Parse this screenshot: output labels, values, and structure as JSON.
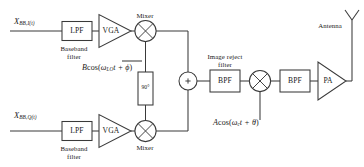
{
  "diagram": {
    "line_color": "#3a3a3a",
    "text_color": "#1a1a1a",
    "background": "#ffffff"
  },
  "inputs": {
    "i_signal": {
      "base": "X",
      "sub": "BB,I(t)",
      "tail": "(t)",
      "full": "X_BB,I(t)"
    },
    "q_signal": {
      "base": "X",
      "sub": "BB,Q(t)",
      "tail": "(t)",
      "full": "X_BB,Q(t)"
    }
  },
  "blocks": {
    "lpf_i": "LPF",
    "lpf_q": "LPF",
    "vga_i": "VGA",
    "vga_q": "VGA",
    "phase_shifter": "90°",
    "bpf_image_reject": "BPF",
    "bpf_output": "BPF",
    "pa": "PA",
    "summer": "+"
  },
  "captions": {
    "baseband_filter_i_line1": "Baseband",
    "baseband_filter_i_line2": "filter",
    "baseband_filter_q_line1": "Baseband",
    "baseband_filter_q_line2": "filter",
    "mixer_i": "Mixer",
    "mixer_q": "Mixer",
    "image_reject_line1": "Image reject",
    "image_reject_line2": "filter",
    "antenna": "Antenna"
  },
  "equations": {
    "lo_baseband": {
      "amp": "B",
      "fn": "cos(",
      "omega": "ω",
      "omega_sub": "LO",
      "time": "t + ",
      "phase": "ϕ",
      "close": ")",
      "full": "B cos( ωLO t + ϕ )"
    },
    "lo_rf": {
      "amp": "A",
      "fn": "cos(",
      "omega": "ω",
      "omega_sub": "c",
      "time": "t + ",
      "phase": "θ",
      "close": ")",
      "full": "A cos( ωc t + θ )"
    }
  }
}
